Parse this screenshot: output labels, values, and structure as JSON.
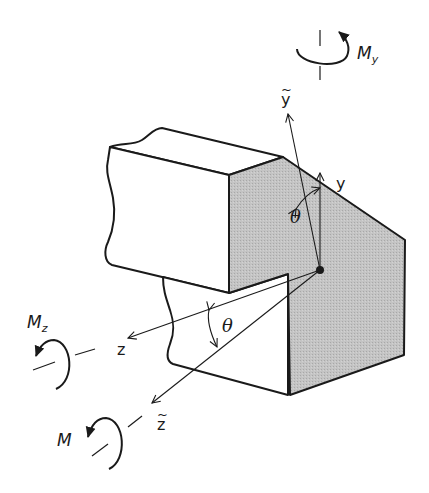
{
  "diagram": {
    "colors": {
      "line": "#1a1a1a",
      "section_fill": "#bdbdbd",
      "background": "#ffffff"
    },
    "centroid": {
      "x": 320,
      "y": 270
    },
    "axes": [
      {
        "id": "y",
        "label": "y",
        "tilde": false
      },
      {
        "id": "y_tilde",
        "label": "y",
        "tilde": true
      },
      {
        "id": "z",
        "label": "z",
        "tilde": false
      },
      {
        "id": "z_tilde",
        "label": "z",
        "tilde": true
      }
    ],
    "angles": [
      {
        "id": "theta_top",
        "symbol": "θ"
      },
      {
        "id": "theta_bottom",
        "symbol": "θ"
      }
    ],
    "moments": [
      {
        "id": "My",
        "base": "M",
        "subscript": "y"
      },
      {
        "id": "Mz",
        "base": "M",
        "subscript": "z"
      },
      {
        "id": "M",
        "base": "M",
        "subscript": ""
      }
    ],
    "tilde_mark": "~"
  }
}
